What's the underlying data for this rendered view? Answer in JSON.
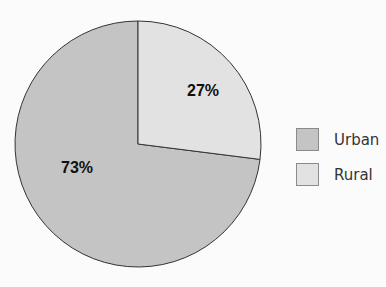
{
  "chart_data": {
    "type": "pie",
    "title": "",
    "categories": [
      "Urban",
      "Rural"
    ],
    "values": [
      73,
      27
    ],
    "labels": [
      "73%",
      "27%"
    ],
    "colors": [
      "#c4c4c4",
      "#e2e2e2"
    ],
    "legend_position": "right",
    "start_angle_deg": 0,
    "direction": "clockwise"
  },
  "legend": {
    "items": [
      {
        "label": "Urban",
        "color": "#c4c4c4"
      },
      {
        "label": "Rural",
        "color": "#e2e2e2"
      }
    ]
  },
  "slices": {
    "urban_label": "73%",
    "rural_label": "27%"
  },
  "style": {
    "outline": "#333333",
    "background": "#fbfbfb"
  }
}
